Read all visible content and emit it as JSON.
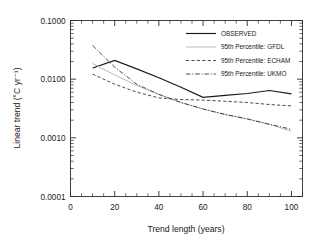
{
  "chart_data": {
    "type": "line",
    "title": "",
    "xlabel": "Trend length (years)",
    "ylabel": "Linear trend (°C yr⁻¹)",
    "yscale": "log",
    "xlim": [
      0,
      105
    ],
    "ylim": [
      0.0001,
      0.1
    ],
    "grid": false,
    "legend_position": "top-right",
    "xticks": [
      0,
      20,
      40,
      60,
      80,
      100
    ],
    "xticklabels": [
      "0",
      "20",
      "40",
      "60",
      "80",
      "100"
    ],
    "yticks": [
      0.0001,
      0.001,
      0.01,
      0.1
    ],
    "yticklabels": [
      "0.0001",
      "0.0010",
      "0.0100",
      "0.1000"
    ],
    "x": [
      10,
      20,
      30,
      40,
      50,
      60,
      70,
      80,
      90,
      100
    ],
    "series": [
      {
        "name": "OBSERVED",
        "style": "solid",
        "color": "#1a1a1a",
        "values": [
          0.0155,
          0.0209,
          0.015,
          0.0106,
          0.0073,
          0.0049,
          0.0053,
          0.0057,
          0.0064,
          0.0056
        ]
      },
      {
        "name": "95th Percentile: GFDL",
        "style": "solid-light",
        "color": "#b9b9b9",
        "values": [
          0.0185,
          0.0118,
          0.0078,
          0.0055,
          0.004,
          0.0031,
          0.0025,
          0.0021,
          0.0017,
          0.0013
        ]
      },
      {
        "name": "95th Percentile: ECHAM",
        "style": "dashed",
        "color": "#2b2b2b",
        "values": [
          0.0122,
          0.0082,
          0.006,
          0.0048,
          0.0045,
          0.0044,
          0.0042,
          0.004,
          0.0037,
          0.0035
        ]
      },
      {
        "name": "95th Percentile: UKMO",
        "style": "dash-dot",
        "color": "#2b2b2b",
        "values": [
          0.0375,
          0.016,
          0.0082,
          0.0055,
          0.004,
          0.0031,
          0.0025,
          0.0021,
          0.0017,
          0.0014
        ]
      }
    ]
  },
  "legend": {
    "entries": [
      {
        "label": "OBSERVED"
      },
      {
        "label": "95th Percentile: GFDL"
      },
      {
        "label": "95th Percentile: ECHAM"
      },
      {
        "label": "95th Percentile: UKMO"
      }
    ]
  }
}
